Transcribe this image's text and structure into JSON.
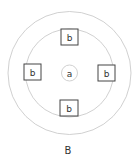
{
  "diagram": {
    "center": {
      "x": 69.5,
      "y": 73
    },
    "outer_circle": {
      "r": 61.5,
      "stroke": "#bdbdbd"
    },
    "inner_circle": {
      "r": 44,
      "stroke": "#bdbdbd"
    },
    "center_circle": {
      "label": "a",
      "r": 8,
      "stroke": "#bdbdbd"
    },
    "boxes": [
      {
        "position": "top",
        "label": "b",
        "x": 61,
        "y": 29,
        "w": 17,
        "h": 16
      },
      {
        "position": "left",
        "label": "b",
        "x": 24,
        "y": 64,
        "w": 17,
        "h": 16
      },
      {
        "position": "right",
        "label": "b",
        "x": 98,
        "y": 65,
        "w": 17,
        "h": 16
      },
      {
        "position": "bottom",
        "label": "b",
        "x": 60,
        "y": 100,
        "w": 18,
        "h": 16
      }
    ],
    "box_stroke": "#444444",
    "caption": "B"
  }
}
